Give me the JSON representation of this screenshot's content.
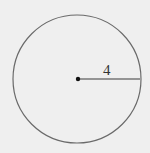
{
  "diagram": {
    "type": "circle-with-radius",
    "radius_label": "4",
    "colors": {
      "background": "#efefef",
      "stroke": "#6a6a6a",
      "radius_line": "#3a3a3a",
      "center_dot": "#111111"
    }
  }
}
